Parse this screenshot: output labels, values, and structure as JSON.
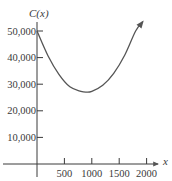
{
  "chart_data": {
    "type": "line",
    "title": "",
    "ylabel": "C(x)",
    "xlabel": "x",
    "xlim": [
      0,
      2100
    ],
    "ylim": [
      0,
      55000
    ],
    "grid": false,
    "legend": null,
    "x_ticks": [
      500,
      1000,
      1500,
      2000
    ],
    "x_tick_labels": [
      "500",
      "1000",
      "1500",
      "2000"
    ],
    "y_ticks": [
      10000,
      20000,
      30000,
      40000,
      50000
    ],
    "y_tick_labels": [
      "10,000",
      "20,000",
      "30,000",
      "40,000",
      "50,000"
    ],
    "series": [
      {
        "name": "C(x)",
        "x": [
          0,
          200,
          400,
          600,
          800,
          900,
          1000,
          1200,
          1400,
          1600,
          1800,
          1930
        ],
        "y": [
          50000,
          40700,
          33700,
          29000,
          27300,
          27000,
          27300,
          29600,
          34100,
          40900,
          50000,
          53500
        ],
        "end_arrow": true
      }
    ],
    "annotations": [
      "minimum near x ≈ 900, C ≈ 27,000"
    ]
  },
  "colors": {
    "axis": "#3a3a3a",
    "curve": "#555555",
    "text": "#3a3a3a"
  }
}
